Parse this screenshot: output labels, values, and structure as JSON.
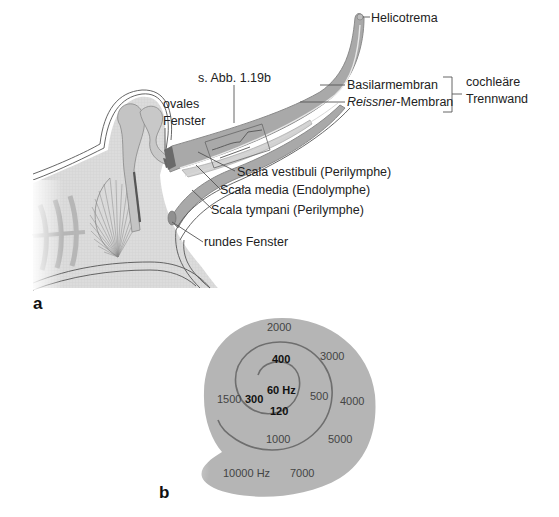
{
  "panel_a": {
    "letter": "a",
    "labels": {
      "helicotrema": "Helicotrema",
      "see_figure": "s. Abb. 1.19b",
      "basilar_membrane": "Basilarmembran",
      "reissner_italic": "Reissner",
      "reissner_suffix": "-Membran",
      "cochlear_partition_line1": "cochleäre",
      "cochlear_partition_line2": "Trennwand",
      "oval_window_line1": "ovales",
      "oval_window_line2": "Fenster",
      "scala_vestibuli": "Scala vestibuli (Perilymphe)",
      "scala_media": "Scala media (Endolymphe)",
      "scala_tympani": "Scala tympani (Perilymphe)",
      "round_window": "rundes Fenster"
    }
  },
  "panel_b": {
    "letter": "b",
    "frequencies": {
      "f60": "60 Hz",
      "f120": "120",
      "f300": "300",
      "f400": "400",
      "f500": "500",
      "f1000": "1000",
      "f1500": "1500",
      "f2000": "2000",
      "f3000": "3000",
      "f4000": "4000",
      "f5000": "5000",
      "f7000": "7000",
      "f10000": "10000 Hz"
    }
  },
  "colors": {
    "tissue_fill": "#d6d6d6",
    "cochlea_duct": "#a9a9a9",
    "spiral_fill": "#b5b5b5",
    "spiral_line": "#6e6e6e",
    "outline": "#8a8a8a"
  }
}
